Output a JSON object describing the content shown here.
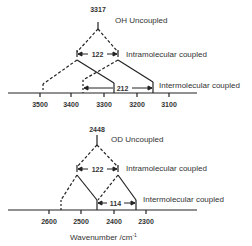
{
  "top": {
    "apex_value": "3317",
    "uncoupled_label": "OH Uncoupled",
    "intra_label": "Intramolecular coupled",
    "intra_split": "122",
    "inter_label": "Intermolecular coupled",
    "inter_split": "212",
    "ticks": [
      "3500",
      "3400",
      "3300",
      "3200",
      "3100"
    ]
  },
  "bottom": {
    "apex_value": "2448",
    "uncoupled_label": "OD Uncoupled",
    "intra_label": "Intramolecular coupled",
    "intra_split": "122",
    "inter_label": "Intermolecular coupled",
    "inter_split": "114",
    "ticks": [
      "2600",
      "2500",
      "2400",
      "2300"
    ]
  },
  "xlabel": "Wavenumber /cm",
  "xlabel_sup": "-1",
  "colors": {
    "line": "#222222"
  }
}
